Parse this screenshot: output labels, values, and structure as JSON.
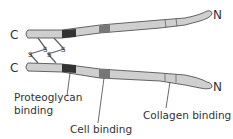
{
  "diagram": {
    "title": "",
    "colors": {
      "tube_fill": "#cfcfcf",
      "tube_stroke": "#555555",
      "proteoglycan_band": "#333333",
      "cell_band": "#777777",
      "leader_line": "#444444",
      "text": "#333333"
    },
    "strands": [
      {
        "id": "top",
        "c_terminus": "C",
        "n_terminus": "N"
      },
      {
        "id": "bottom",
        "c_terminus": "C",
        "n_terminus": "N"
      }
    ],
    "disulfide_bonds": [
      {
        "label": "S"
      },
      {
        "label": "S"
      },
      {
        "label": "S"
      },
      {
        "label": "S"
      }
    ],
    "labels": {
      "proteoglycan_line1": "Proteoglycan",
      "proteoglycan_line2": "binding",
      "cell": "Cell binding",
      "collagen": "Collagen binding"
    }
  }
}
